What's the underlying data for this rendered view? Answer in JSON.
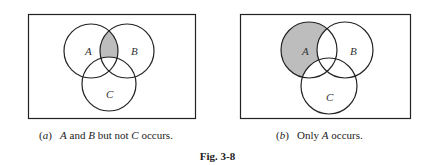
{
  "figure": {
    "label": "Fig. 3-8",
    "panels": [
      {
        "id": "a",
        "tag": "(a)",
        "caption_parts": [
          "A",
          " and ",
          "B",
          " but not ",
          "C",
          " occurs."
        ],
        "set_labels": {
          "A": "A",
          "B": "B",
          "C": "C"
        },
        "shaded_region": "A ∩ B ∩ C'"
      },
      {
        "id": "b",
        "tag": "(b)",
        "caption_parts": [
          "Only ",
          "A",
          " occurs."
        ],
        "set_labels": {
          "A": "A",
          "B": "B",
          "C": "C"
        },
        "shaded_region": "A ∩ B' ∩ C'"
      }
    ],
    "colors": {
      "shade": "#bdbdbd",
      "stroke": "#222222"
    }
  }
}
